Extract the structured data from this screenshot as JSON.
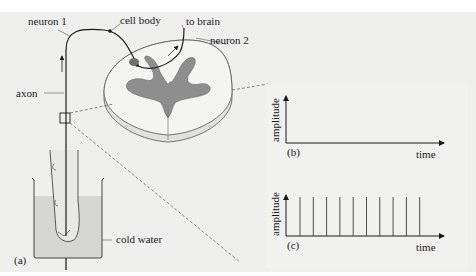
{
  "figure": {
    "panel_a": {
      "label": "(a)",
      "labels": {
        "neuron1": "neuron 1",
        "cell_body": "cell body",
        "to_brain": "to brain",
        "neuron2": "neuron 2",
        "axon": "axon",
        "cold_water": "cold water"
      }
    },
    "panel_b": {
      "label": "(b)",
      "ylabel": "amplitude",
      "xlabel": "time"
    },
    "panel_c": {
      "label": "(c)",
      "ylabel": "amplitude",
      "xlabel": "time"
    },
    "colors": {
      "background": "#efefee",
      "grey_matter": "#8e8e8e",
      "white_matter": "#f4f4f2",
      "water": "#d6d6d4",
      "line": "#1a1a1a"
    }
  },
  "chart_data": [
    {
      "type": "line",
      "title": "(b)",
      "xlabel": "time",
      "ylabel": "amplitude",
      "x": [],
      "series": [
        {
          "name": "signal",
          "values": []
        }
      ],
      "grid": false,
      "legend": "none",
      "note": "empty axes — no action potentials"
    },
    {
      "type": "bar",
      "title": "(c)",
      "xlabel": "time",
      "ylabel": "amplitude",
      "categories": [
        1,
        2,
        3,
        4,
        5,
        6,
        7,
        8,
        9,
        10
      ],
      "values": [
        1,
        1,
        1,
        1,
        1,
        1,
        1,
        1,
        1,
        1
      ],
      "grid": false,
      "legend": "none",
      "note": "train of 10 equally spaced, equal-height spikes"
    }
  ]
}
